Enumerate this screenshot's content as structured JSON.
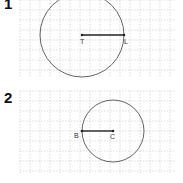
{
  "figures": [
    {
      "number": "1",
      "grid": {
        "x": 20,
        "y": 0,
        "width": 155,
        "height": 78,
        "cell": 10
      },
      "circle": {
        "cx": 82,
        "cy": 35,
        "r": 42
      },
      "segment": {
        "x1": 82,
        "y1": 35,
        "x2": 124,
        "y2": 35
      },
      "points": [
        {
          "label": "T",
          "x": 82,
          "y": 35,
          "lx": 80,
          "ly": 44
        },
        {
          "label": "L",
          "x": 124,
          "y": 35,
          "lx": 124,
          "ly": 44
        }
      ]
    },
    {
      "number": "2",
      "grid": {
        "x": 20,
        "y": 91,
        "width": 155,
        "height": 82,
        "cell": 10
      },
      "circle": {
        "cx": 113,
        "cy": 131,
        "r": 31
      },
      "segment": {
        "x1": 82,
        "y1": 131,
        "x2": 113,
        "y2": 131
      },
      "points": [
        {
          "label": "B",
          "x": 82,
          "y": 131,
          "lx": 74,
          "ly": 138
        },
        {
          "label": "C",
          "x": 113,
          "y": 131,
          "lx": 110,
          "ly": 139
        }
      ]
    }
  ],
  "colors": {
    "grid": "#c8c8c8",
    "circle": "#555555",
    "segment": "#222222"
  }
}
